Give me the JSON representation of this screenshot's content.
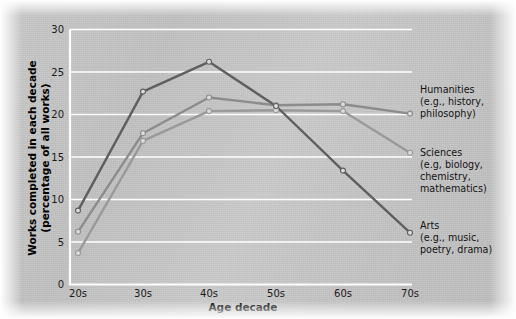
{
  "chart_data": {
    "type": "line",
    "title": "",
    "xlabel": "Age decade",
    "ylabel": "Works completed in each decade (percentage of all works)",
    "ylabel_line1": "Works completed in each decade",
    "ylabel_line2": "(percentage of all works)",
    "categories": [
      "20s",
      "30s",
      "40s",
      "50s",
      "60s",
      "70s"
    ],
    "xtick_labels": [
      "20s",
      "30s",
      "40s",
      "50s",
      "60s",
      "70s"
    ],
    "ytick_labels": [
      "0",
      "5",
      "10",
      "15",
      "20",
      "25",
      "30"
    ],
    "ylim": [
      0,
      30
    ],
    "ytick_step": 5,
    "grid": "horizontal-white",
    "legend_position": "right-of-plot-at-line-ends",
    "series": [
      {
        "name": "Humanities",
        "legend_label": "Humanities",
        "legend_detail_line1": "(e.g., history,",
        "legend_detail_line2": "philosophy)",
        "color": "#8c8c8c",
        "values": [
          6.2,
          17.8,
          22.0,
          21.1,
          21.2,
          20.1
        ]
      },
      {
        "name": "Sciences",
        "legend_label": "Sciences",
        "legend_detail_line1": "(e.g, biology,",
        "legend_detail_line2": "chemistry,",
        "legend_detail_line3": "mathematics)",
        "color": "#9a9a9a",
        "values": [
          3.7,
          16.9,
          20.4,
          20.5,
          20.4,
          15.5
        ]
      },
      {
        "name": "Arts",
        "legend_label": "Arts",
        "legend_detail_line1": "(e.g., music,",
        "legend_detail_line2": "poetry, drama)",
        "color": "#5f5f5f",
        "values": [
          8.7,
          22.7,
          26.2,
          21.0,
          13.4,
          6.1
        ]
      }
    ]
  }
}
